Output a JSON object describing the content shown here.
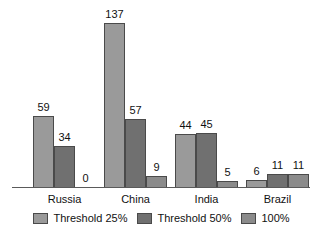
{
  "chart_data": {
    "type": "bar",
    "title": "",
    "subtitle": "",
    "xlabel": "",
    "ylabel": "",
    "ylim": [
      0,
      140
    ],
    "grid": false,
    "legend_position": "bottom",
    "categories": [
      "Russia",
      "China",
      "India",
      "Brazil"
    ],
    "series": [
      {
        "name": "Threshold 25%",
        "color": "#9a9a9a",
        "values": [
          59,
          137,
          44,
          6
        ],
        "labels": [
          "59",
          "137",
          "44",
          "6"
        ]
      },
      {
        "name": "Threshold 50%",
        "color": "#707070",
        "values": [
          34,
          57,
          45,
          11
        ],
        "labels": [
          "34",
          "57",
          "45",
          "11"
        ]
      },
      {
        "name": "100%",
        "color": "#8b8b8b",
        "values": [
          0,
          9,
          5,
          11
        ],
        "labels": [
          "0",
          "9",
          "5",
          "11"
        ]
      }
    ]
  },
  "legend": {
    "items": [
      {
        "label": "Threshold 25%",
        "color": "#9a9a9a"
      },
      {
        "label": "Threshold 50%",
        "color": "#707070"
      },
      {
        "label": "100%",
        "color": "#8b8b8b"
      }
    ]
  },
  "axis": {
    "baseline_color": "#5a5a5a"
  }
}
